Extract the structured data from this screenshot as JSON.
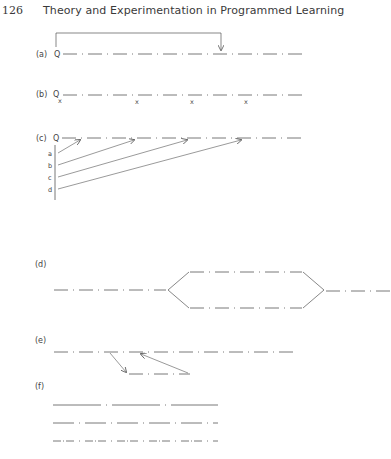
{
  "header": {
    "page_number": "126",
    "running_title": "Theory and Experimentation in Programmed Learning"
  },
  "figure": {
    "panels": [
      {
        "id": "a",
        "label": "(a)",
        "start_marker": "Q",
        "description": "Linear frame sequence with a loop-back arrow from Q to a later frame"
      },
      {
        "id": "b",
        "label": "(b)",
        "start_marker": "Q",
        "marks": [
          "x",
          "x",
          "x",
          "x"
        ],
        "description": "Linear sequence with x marks under frames"
      },
      {
        "id": "c",
        "label": "(c)",
        "start_marker": "Q",
        "branch_labels": [
          "a",
          "b",
          "c",
          "d"
        ],
        "description": "Entry points a–d with arrows into the main sequence"
      },
      {
        "id": "d",
        "label": "(d)",
        "description": "Sequence splitting into two parallel paths and rejoining"
      },
      {
        "id": "e",
        "label": "(e)",
        "description": "Main sequence with a remedial sub-branch and return arrow"
      },
      {
        "id": "f",
        "label": "(f)",
        "description": "Three parallel sequences with differing step sizes"
      }
    ]
  },
  "colors": {
    "ink": "#444444",
    "background": "#ffffff"
  }
}
